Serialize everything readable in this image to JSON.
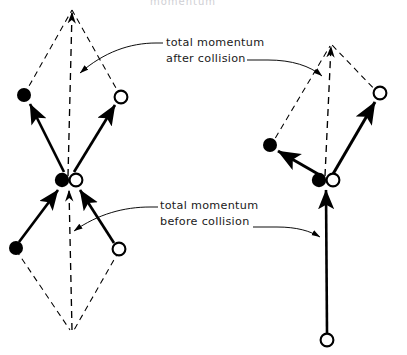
{
  "figure": {
    "kind": "physics-vector-diagram",
    "topic": "conservation of momentum in a two-body collision",
    "cropped_top_text": "momentum",
    "ink_color": "#000000",
    "background_color": "#ffffff"
  },
  "annotations": [
    {
      "id": "after",
      "line1": "total momentum",
      "line2": "after collision",
      "x": 166,
      "y": 40,
      "points_to": [
        "left-resultant-after",
        "right-resultant-after"
      ]
    },
    {
      "id": "before",
      "line1": "total momentum",
      "line2": "before collision",
      "x": 160,
      "y": 203,
      "points_to": [
        "left-resultant-before",
        "right-resultant-before"
      ]
    }
  ],
  "diagrams": [
    {
      "id": "left",
      "name": "head-on-symmetric-collision",
      "collision_point": {
        "x": 68,
        "y": 180
      },
      "bodies_at_collision": [
        {
          "marker": "filled-circle",
          "x": 62,
          "y": 180,
          "r": 7
        },
        {
          "marker": "hollow-circle",
          "x": 76,
          "y": 180,
          "r": 6.5
        }
      ],
      "after": {
        "vectors": [
          {
            "marker": "filled-circle",
            "tip_x": 24,
            "tip_y": 95,
            "style": "solid"
          },
          {
            "marker": "hollow-circle",
            "tip_x": 121,
            "tip_y": 97,
            "style": "solid"
          }
        ],
        "resultant": {
          "tip_x": 72,
          "tip_y": 8,
          "style": "dashed-axis"
        },
        "parallelogram": "dashed"
      },
      "before": {
        "vectors": [
          {
            "marker": "filled-circle",
            "tail_x": 16,
            "tail_y": 248,
            "style": "solid"
          },
          {
            "marker": "hollow-circle",
            "tail_x": 119,
            "tail_y": 249,
            "style": "solid"
          }
        ],
        "resultant": {
          "tail_x": 72,
          "tail_y": 330,
          "style": "dashed-axis"
        },
        "parallelogram": "dashed"
      }
    },
    {
      "id": "right",
      "name": "oblique-collision-one-body-at-rest",
      "collision_point": {
        "x": 325,
        "y": 180
      },
      "bodies_at_collision": [
        {
          "marker": "filled-circle",
          "x": 319,
          "y": 180,
          "r": 7
        },
        {
          "marker": "hollow-circle",
          "x": 333,
          "y": 180,
          "r": 6.5
        }
      ],
      "after": {
        "vectors": [
          {
            "marker": "filled-circle",
            "tip_x": 270,
            "tip_y": 145,
            "style": "solid"
          },
          {
            "marker": "hollow-circle",
            "tip_x": 380,
            "tip_y": 93,
            "style": "solid"
          }
        ],
        "resultant": {
          "tip_x": 331,
          "tip_y": 42,
          "style": "dashed-axis"
        },
        "parallelogram": "dashed"
      },
      "before": {
        "vectors": [
          {
            "marker": "hollow-circle",
            "tail_x": 354,
            "tail_y": 340,
            "style": "solid-long"
          }
        ],
        "resultant": {
          "tail_x": 354,
          "tail_y": 340,
          "style": "coincident-with-vector"
        },
        "parallelogram": "none"
      }
    }
  ]
}
